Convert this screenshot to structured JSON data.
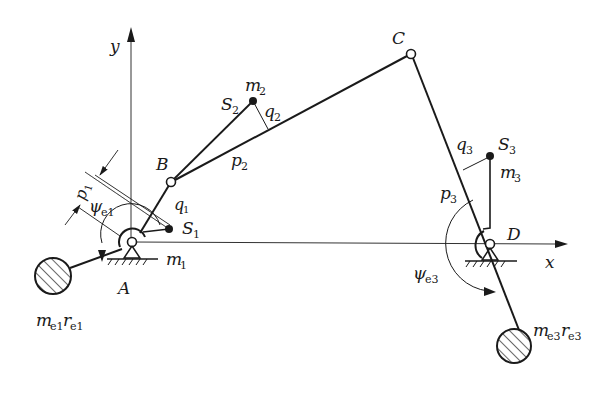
{
  "diagram": {
    "axes": {
      "x_label": "x",
      "y_label": "y"
    },
    "joints": {
      "A": {
        "label": "A",
        "mass": "m",
        "mass_sub": "1"
      },
      "B": {
        "label": "B"
      },
      "C": {
        "label": "C"
      },
      "D": {
        "label": "D"
      }
    },
    "centers_of_mass": {
      "S1": {
        "label": "S",
        "sub": "1"
      },
      "S2": {
        "label": "S",
        "sub": "2",
        "mass": "m",
        "mass_sub": "2"
      },
      "S3": {
        "label": "S",
        "sub": "3",
        "mass": "m",
        "mass_sub": "3"
      }
    },
    "dimensions": {
      "p1": {
        "label": "p",
        "sub": "1"
      },
      "q1": {
        "label": "q",
        "sub": "1"
      },
      "p2": {
        "label": "p",
        "sub": "2"
      },
      "q2": {
        "label": "q",
        "sub": "2"
      },
      "p3": {
        "label": "p",
        "sub": "3"
      },
      "q3": {
        "label": "q",
        "sub": "3"
      }
    },
    "angles": {
      "psi_e1": {
        "label": "ψ",
        "sub": "e1"
      },
      "psi_e3": {
        "label": "ψ",
        "sub": "e3"
      }
    },
    "counterweights": {
      "left": {
        "m": "m",
        "m_sub": "e1",
        "r": "r",
        "r_sub": "e1"
      },
      "right": {
        "m": "m",
        "m_sub": "e3",
        "r": "r",
        "r_sub": "e3"
      }
    },
    "colors": {
      "line": "#1a1a1a",
      "axis": "#333333"
    }
  }
}
